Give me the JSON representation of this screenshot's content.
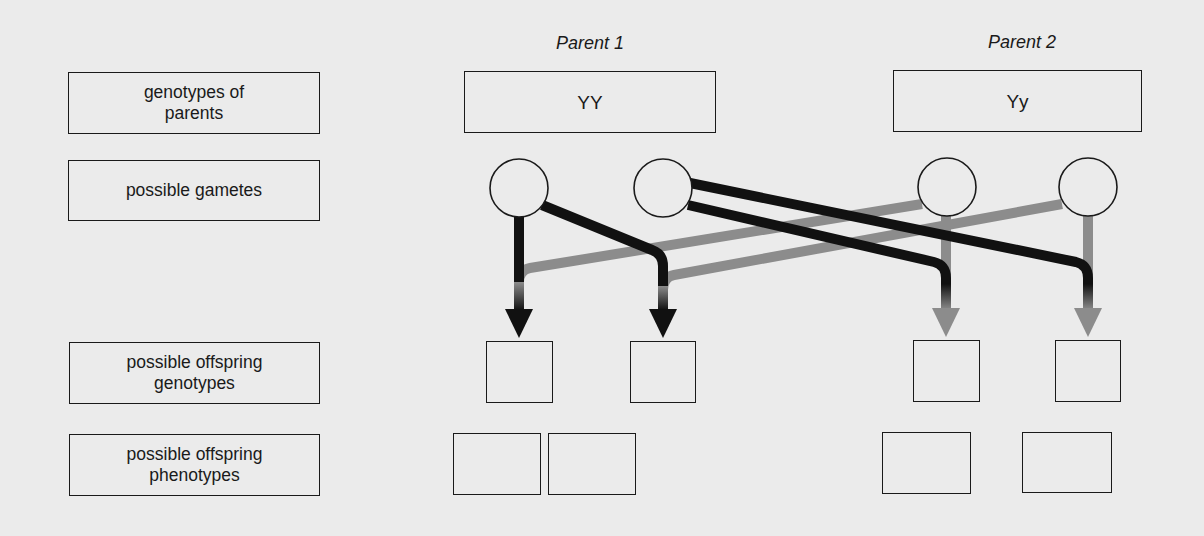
{
  "row_labels": {
    "genotypes_of_parents": "genotypes of\nparents",
    "possible_gametes": "possible gametes",
    "possible_offspring_genotypes": "possible offspring\ngenotypes",
    "possible_offspring_phenotypes": "possible offspring\nphenotypes"
  },
  "parents": [
    {
      "label": "Parent 1",
      "genotype": "YY",
      "line_color": "#111111"
    },
    {
      "label": "Parent 2",
      "genotype": "Yy",
      "line_color": "#8c8c8c"
    }
  ],
  "gametes": [
    {
      "parent": 1,
      "value": ""
    },
    {
      "parent": 1,
      "value": ""
    },
    {
      "parent": 2,
      "value": ""
    },
    {
      "parent": 2,
      "value": ""
    }
  ],
  "offspring_genotypes": [
    "",
    "",
    "",
    ""
  ],
  "offspring_phenotypes": [
    "",
    "",
    "",
    ""
  ],
  "colors": {
    "background": "#ebebeb",
    "outline": "#1a1a1a",
    "parent1_arrow": "#111111",
    "parent2_arrow": "#8c8c8c"
  }
}
